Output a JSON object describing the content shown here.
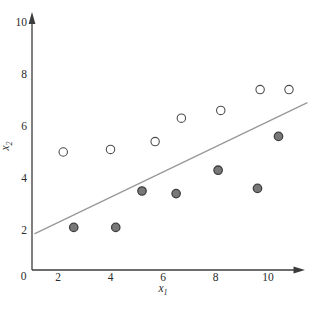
{
  "figure": {
    "background": "#ffffff",
    "axis_color": "#3c3c3c",
    "text_color": "#2b2b2b"
  },
  "chart_data": {
    "type": "scatter",
    "title": "",
    "xlabel": {
      "base": "x",
      "sub": "1"
    },
    "ylabel": {
      "base": "x",
      "sub": "2"
    },
    "xlim": [
      0,
      11.6
    ],
    "ylim": [
      0,
      10.6
    ],
    "x_ticks": [
      2,
      4,
      6,
      8,
      10
    ],
    "y_ticks": [
      2,
      4,
      6,
      8,
      10
    ],
    "origin_label": "0",
    "grid": false,
    "legend": null,
    "series": [
      {
        "name": "open-class",
        "marker": "open-circle",
        "fill": "#ffffff",
        "stroke": "#4d4d4d",
        "points": [
          [
            2.2,
            5.0
          ],
          [
            4.0,
            5.1
          ],
          [
            5.7,
            5.4
          ],
          [
            6.7,
            6.3
          ],
          [
            8.2,
            6.6
          ],
          [
            9.7,
            7.4
          ],
          [
            10.8,
            7.4
          ]
        ]
      },
      {
        "name": "filled-class",
        "marker": "filled-circle",
        "fill": "#787878",
        "stroke": "#3f3f3f",
        "points": [
          [
            2.6,
            2.1
          ],
          [
            4.2,
            2.1
          ],
          [
            5.2,
            3.5
          ],
          [
            6.5,
            3.4
          ],
          [
            8.1,
            4.3
          ],
          [
            9.6,
            3.6
          ],
          [
            10.4,
            5.6
          ]
        ]
      }
    ],
    "separator_line": {
      "from": [
        1.1,
        1.85
      ],
      "to": [
        11.5,
        6.9
      ],
      "color": "#999999"
    }
  }
}
